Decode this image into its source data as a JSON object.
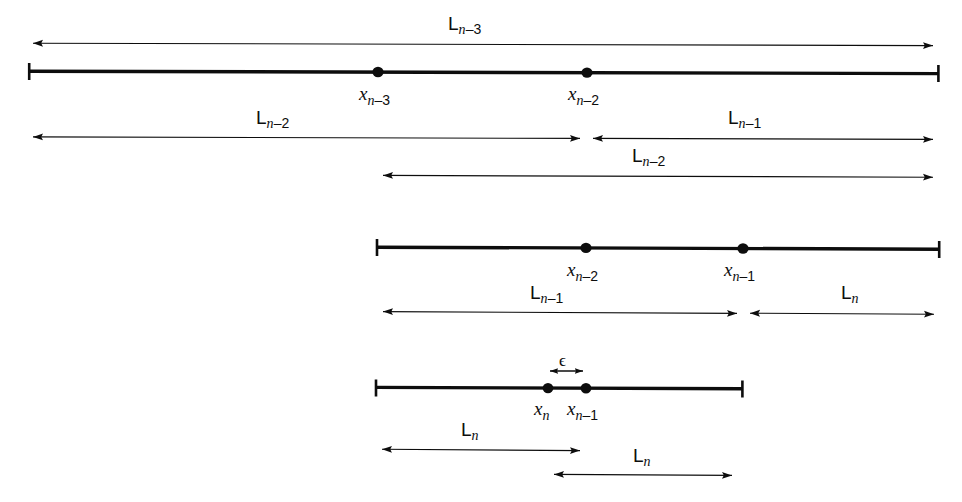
{
  "figure": {
    "type": "number-line-diagram",
    "background_color": "#ffffff",
    "ink_color": "#0d0d0d"
  },
  "labels": {
    "L_n_minus_3": "L",
    "L_n_minus_3_sub": "n",
    "L_n_minus_3_sub2": "–3",
    "L_n_minus_2": "L",
    "L_n_minus_2_sub": "n",
    "L_n_minus_2_sub2": "–2",
    "L_n_minus_1": "L",
    "L_n_minus_1_sub": "n",
    "L_n_minus_1_sub2": "–1",
    "L_n": "L",
    "L_n_sub": "n",
    "x_base": "x",
    "x_n_minus_3_sub": "n",
    "x_n_minus_3_sub2": "–3",
    "x_n_minus_2_sub2": "–2",
    "x_n_minus_1_sub2": "–1",
    "epsilon": "ϵ"
  },
  "rows": [
    {
      "name": "row-1",
      "span_arrow_above": {
        "label": "L_{n-3}",
        "x1": 27,
        "x2": 939,
        "y": 44
      },
      "segment": {
        "x1": 28,
        "x2": 939,
        "y": 72
      },
      "points": [
        {
          "name": "x_{n-3}",
          "x": 378,
          "y": 72
        },
        {
          "name": "x_{n-2}",
          "x": 587,
          "y": 72
        }
      ],
      "span_arrows_below": [
        {
          "label": "L_{n-2}",
          "x1": 27,
          "x2": 586,
          "y": 138
        },
        {
          "label": "L_{n-1}",
          "x1": 587,
          "x2": 939,
          "y": 138
        },
        {
          "label": "L_{n-2}",
          "x1": 377,
          "x2": 939,
          "y": 176
        }
      ]
    },
    {
      "name": "row-2",
      "segment": {
        "x1": 376,
        "x2": 940,
        "y": 248
      },
      "points": [
        {
          "name": "x_{n-2}",
          "x": 586,
          "y": 248
        },
        {
          "name": "x_{n-1}",
          "x": 743,
          "y": 248
        }
      ],
      "span_arrows_below": [
        {
          "label": "L_{n-1}",
          "x1": 377,
          "x2": 742,
          "y": 313
        },
        {
          "label": "L_n",
          "x1": 744,
          "x2": 940,
          "y": 313
        }
      ]
    },
    {
      "name": "row-3",
      "span_arrow_above": {
        "label": "ϵ",
        "x1": 548,
        "x2": 585,
        "y": 371
      },
      "segment": {
        "x1": 375,
        "x2": 743,
        "y": 388
      },
      "points": [
        {
          "name": "x_n",
          "x": 548,
          "y": 388
        },
        {
          "name": "x_{n-1}",
          "x": 586,
          "y": 388
        }
      ],
      "span_arrows_below": [
        {
          "label": "L_n",
          "x1": 376,
          "x2": 586,
          "y": 450
        },
        {
          "label": "L_n",
          "x1": 548,
          "x2": 738,
          "y": 475
        }
      ]
    }
  ],
  "label_positions": {
    "L_n_minus_3_top": {
      "x": 448,
      "y": 14
    },
    "L_n_minus_2_left": {
      "x": 256,
      "y": 108
    },
    "L_n_minus_1_right": {
      "x": 728,
      "y": 108
    },
    "L_n_minus_2_mid": {
      "x": 632,
      "y": 146
    },
    "x_n_minus_3": {
      "x": 359,
      "y": 84
    },
    "x_n_minus_2_row1": {
      "x": 568,
      "y": 84
    },
    "x_n_minus_2_row2": {
      "x": 567,
      "y": 260
    },
    "x_n_minus_1_row2": {
      "x": 724,
      "y": 260
    },
    "L_n_minus_1_row2": {
      "x": 530,
      "y": 283
    },
    "L_n_row2": {
      "x": 841,
      "y": 283
    },
    "epsilon_label": {
      "x": 559,
      "y": 352
    },
    "x_n_row3": {
      "x": 534,
      "y": 399
    },
    "x_n_minus_1_row3": {
      "x": 567,
      "y": 399
    },
    "L_n_row3_left": {
      "x": 461,
      "y": 420
    },
    "L_n_row3_right": {
      "x": 633,
      "y": 446
    }
  }
}
